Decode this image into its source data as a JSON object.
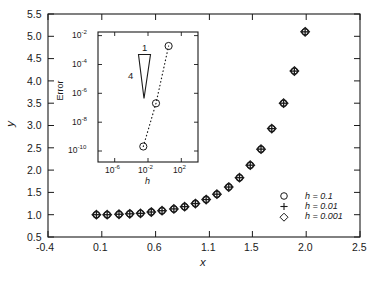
{
  "chart_data": {
    "type": "scatter",
    "title": "",
    "xlabel": "x",
    "ylabel": "y",
    "xlim": [
      -0.4,
      2.5
    ],
    "ylim": [
      0.5,
      5.5
    ],
    "grid": false,
    "x_ticks": [
      "-0.4",
      "0.1",
      "0.6",
      "1.1",
      "1.5",
      "2.0",
      "2.5"
    ],
    "x_tick_values": [
      -0.4,
      0.1,
      0.6,
      1.1,
      1.5,
      2.0,
      2.5
    ],
    "y_ticks": [
      "0.5",
      "1.0",
      "1.5",
      "2.0",
      "2.5",
      "3.0",
      "3.5",
      "4.0",
      "4.5",
      "5.0",
      "5.5"
    ],
    "y_tick_values": [
      0.5,
      1.0,
      1.5,
      2.0,
      2.5,
      3.0,
      3.5,
      4.0,
      4.5,
      5.0,
      5.5
    ],
    "x": [
      0.05,
      0.15,
      0.26,
      0.36,
      0.46,
      0.56,
      0.66,
      0.77,
      0.87,
      0.97,
      1.07,
      1.17,
      1.28,
      1.38,
      1.48,
      1.58,
      1.68,
      1.79,
      1.89,
      1.99
    ],
    "series": [
      {
        "name": "h = 0.1",
        "marker": "circle",
        "values": [
          1.0,
          1.0,
          1.01,
          1.02,
          1.03,
          1.06,
          1.09,
          1.13,
          1.18,
          1.25,
          1.34,
          1.46,
          1.62,
          1.83,
          2.11,
          2.47,
          2.93,
          3.5,
          4.22,
          5.1
        ]
      },
      {
        "name": "h = 0.01",
        "marker": "plus",
        "values": [
          1.0,
          1.0,
          1.01,
          1.02,
          1.03,
          1.06,
          1.09,
          1.13,
          1.18,
          1.25,
          1.34,
          1.46,
          1.62,
          1.83,
          2.11,
          2.47,
          2.93,
          3.5,
          4.22,
          5.1
        ]
      },
      {
        "name": "h = 0.001",
        "marker": "diamond",
        "values": [
          1.0,
          1.0,
          1.01,
          1.02,
          1.03,
          1.06,
          1.09,
          1.13,
          1.18,
          1.25,
          1.34,
          1.46,
          1.62,
          1.83,
          2.11,
          2.47,
          2.93,
          3.5,
          4.22,
          5.1
        ]
      }
    ],
    "legend": {
      "position": "lower-right",
      "entries": [
        {
          "marker": "circle",
          "label": "h = 0.1"
        },
        {
          "marker": "plus",
          "label": "h = 0.01"
        },
        {
          "marker": "diamond",
          "label": "h = 0.001"
        }
      ]
    },
    "inset": {
      "type": "line",
      "scale": "log-log",
      "xlabel": "h",
      "ylabel": "Error",
      "xlim": [
        1e-08,
        10000.0
      ],
      "ylim": [
        1e-11,
        0.01
      ],
      "x_ticks": [
        "10-6",
        "10-2",
        "102"
      ],
      "x_tick_exponents": [
        "-6",
        "-2",
        "2"
      ],
      "x_tick_values": [
        1e-06,
        0.01,
        100.0
      ],
      "y_ticks": [
        "10-2",
        "10-4",
        "10-6",
        "10-8",
        "10-10"
      ],
      "y_tick_exponents": [
        "-2",
        "-4",
        "-6",
        "-8",
        "-10"
      ],
      "y_tick_values": [
        0.01,
        0.0001,
        1e-06,
        1e-08,
        1e-10
      ],
      "linestyle": "dotted",
      "marker": "circle",
      "x": [
        0.001,
        0.01,
        0.1
      ],
      "values": [
        1e-10,
        1e-07,
        0.001
      ],
      "slope_triangle": {
        "rise_label": "4",
        "run_label": "1",
        "slope": 4
      }
    }
  }
}
